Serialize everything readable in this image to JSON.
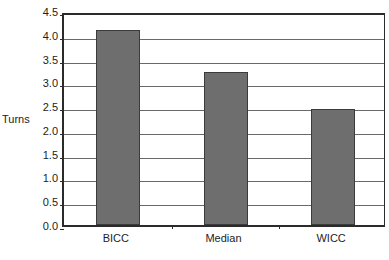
{
  "chart_data": {
    "type": "bar",
    "title": "",
    "subtitle": "",
    "xlabel": "",
    "ylabel": "Turns",
    "categories": [
      "BICC",
      "Median",
      "WICC"
    ],
    "values": [
      4.1,
      3.22,
      2.44
    ],
    "series": [
      {
        "name": "Turns",
        "values": [
          4.1,
          3.22,
          2.44
        ]
      }
    ],
    "ylim": [
      0.0,
      4.5
    ],
    "yticks": [
      "0.0",
      "0.5",
      "1.0",
      "1.5",
      "2.0",
      "2.5",
      "3.0",
      "3.5",
      "4.0",
      "4.5"
    ],
    "ytick_values": [
      0.0,
      0.5,
      1.0,
      1.5,
      2.0,
      2.5,
      3.0,
      3.5,
      4.0,
      4.5
    ],
    "grid": "horizontal",
    "legend": "none",
    "bar_color": "#6e6e6e",
    "bar_edge_color": "#3b3b3b",
    "axis_color": "#2b2b2b",
    "gridline_color": "#6a6a6a",
    "background_color": "#ffffff"
  },
  "caption_sliver": "· · · · · · · · · · · · · · · ·"
}
